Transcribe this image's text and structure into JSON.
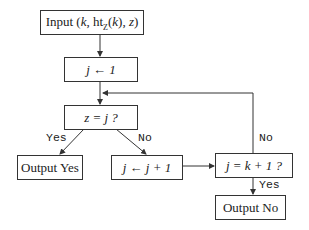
{
  "nodes": {
    "input": {
      "label": "Input (k, htℤ(k), z)",
      "prefix": "Input (",
      "k": "k",
      "sep1": ", ht",
      "sub": "Z",
      "paren_k": "(k)",
      "sep2": ", ",
      "z": "z",
      "suffix": ")"
    },
    "init": {
      "label": "j ← 1"
    },
    "test1": {
      "label": "z = j ?"
    },
    "out_yes": {
      "label": "Output Yes",
      "word": "Output",
      "value": "Yes"
    },
    "incr": {
      "label": "j ← j + 1"
    },
    "test2": {
      "label": "j = k + 1 ?"
    },
    "out_no": {
      "label": "Output No",
      "word": "Output",
      "value": "No"
    }
  },
  "edges": {
    "test1_yes": "Yes",
    "test1_no": "No",
    "test2_no": "No",
    "test2_yes": "Yes"
  },
  "colors": {
    "stroke": "#333333",
    "background": "#ffffff"
  }
}
